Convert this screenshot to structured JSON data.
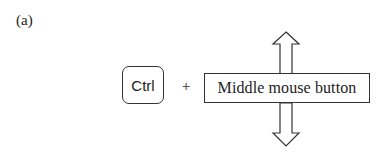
{
  "figure": {
    "panel_label": "(a)",
    "key_label": "Ctrl",
    "operator": "+",
    "mouse_button_label": "Middle mouse button",
    "arrows": [
      "up-arrow",
      "down-arrow"
    ],
    "stroke_color": "#333333",
    "background_color": "#ffffff"
  }
}
